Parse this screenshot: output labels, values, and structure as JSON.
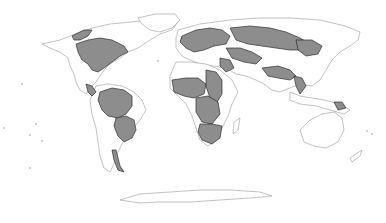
{
  "map": {
    "title": "",
    "projection": "world-pseudocylindrical",
    "background_color": "#ffffff",
    "coast_color": "#a8a8a8",
    "highlight_fill": "#8d8d8d",
    "highlight_stroke": "#2e2e2e",
    "land": [
      {
        "name": "north-america",
        "d": "M42 44 L60 40 L75 34 L92 28 L110 24 L130 22 L150 20 L170 18 L178 22 L172 30 L160 34 L150 40 L138 48 L128 52 L120 58 L110 64 L104 70 L100 76 L96 82 L90 88 L86 94 L80 90 L76 82 L74 74 L70 66 L68 58 L60 52 L50 48 Z"
      },
      {
        "name": "greenland",
        "d": "M138 18 L155 14 L175 14 L180 20 L172 28 L160 32 L150 30 L142 24 Z"
      },
      {
        "name": "south-america",
        "d": "M96 86 L108 84 L122 86 L134 92 L142 100 L146 110 L140 120 L132 130 L124 140 L118 152 L114 164 L110 172 L104 168 L100 156 L98 142 L96 128 L92 114 L90 100 Z"
      },
      {
        "name": "europe-asia",
        "d": "M178 30 L200 24 L230 20 L260 18 L290 18 L320 20 L345 26 L360 32 L358 40 L350 46 L340 52 L332 60 L326 70 L320 80 L312 86 L300 84 L290 88 L280 92 L272 90 L264 84 L256 80 L246 76 L236 74 L226 68 L214 66 L200 64 L190 60 L182 56 L176 48 L176 38 Z"
      },
      {
        "name": "africa",
        "d": "M176 62 L190 62 L206 64 L220 70 L232 80 L238 92 L232 104 L228 116 L222 128 L216 140 L208 146 L200 140 L196 128 L192 116 L186 104 L178 96 L170 88 L170 76 Z"
      },
      {
        "name": "madagascar",
        "d": "M234 122 L240 118 L238 130 L233 134 Z"
      },
      {
        "name": "southeast-asia-islands",
        "d": "M290 92 L300 96 L312 98 L324 100 L340 104 L350 110 L344 114 L330 110 L316 106 L300 104 L290 100 Z"
      },
      {
        "name": "australia",
        "d": "M300 130 L310 120 L322 114 L334 112 L342 118 L344 130 L338 142 L326 148 L314 146 L304 142 Z"
      },
      {
        "name": "new-zealand",
        "d": "M350 158 L362 150 L360 156 L352 162 Z"
      },
      {
        "name": "antarctica",
        "d": "M120 200 L140 194 L170 192 L200 190 L230 190 L260 192 L272 196 L250 198 L220 200 L190 202 L160 202 L140 203 Z"
      }
    ],
    "basins": [
      {
        "name": "mackenzie-basin",
        "d": "M72 36 L84 30 L92 30 L88 36 L80 40 L74 40 Z"
      },
      {
        "name": "nelson-mississippi-basin",
        "d": "M76 44 L88 40 L100 38 L112 40 L124 46 L128 52 L120 56 L112 62 L104 68 L98 72 L92 70 L88 64 L82 60 L78 52 Z"
      },
      {
        "name": "central-america-basin",
        "d": "M86 84 L92 86 L96 92 L92 96 L88 92 Z"
      },
      {
        "name": "amazon-basin",
        "d": "M100 92 L112 88 L124 90 L132 96 L132 106 L126 114 L118 118 L108 116 L102 110 L98 100 Z"
      },
      {
        "name": "parana-basin",
        "d": "M116 118 L126 116 L134 120 L136 130 L132 138 L124 142 L118 136 L114 126 Z"
      },
      {
        "name": "patagonia-strip",
        "d": "M112 150 L116 150 L120 166 L124 172 L118 170 L114 160 Z"
      },
      {
        "name": "europe-basins",
        "d": "M182 36 L196 30 L210 28 L222 30 L230 36 L226 44 L214 46 L204 50 L194 52 L186 48 L180 42 Z"
      },
      {
        "name": "ob-yenisei-basin",
        "d": "M230 28 L250 26 L270 28 L286 32 L300 38 L310 44 L304 50 L290 50 L276 48 L262 46 L248 44 L236 40 Z"
      },
      {
        "name": "lena-amur-basin",
        "d": "M296 40 L312 40 L322 46 L318 54 L306 56 L298 50 Z"
      },
      {
        "name": "central-asia-basin",
        "d": "M226 48 L240 48 L252 52 L262 58 L256 64 L244 62 L232 58 Z"
      },
      {
        "name": "indus-ganges-basin",
        "d": "M262 68 L278 66 L290 70 L296 76 L290 80 L278 78 L268 76 Z"
      },
      {
        "name": "mekong-basin",
        "d": "M294 76 L302 78 L306 86 L300 94 L296 86 Z"
      },
      {
        "name": "middle-east-basin",
        "d": "M220 58 L230 60 L234 68 L226 72 L220 66 Z"
      },
      {
        "name": "west-africa-basins",
        "d": "M172 80 L186 78 L198 78 L206 84 L204 94 L194 98 L184 96 L174 92 Z"
      },
      {
        "name": "nile-basin",
        "d": "M206 70 L216 72 L222 80 L222 94 L216 104 L210 98 L206 86 Z"
      },
      {
        "name": "congo-basin",
        "d": "M196 98 L208 96 L218 102 L220 114 L212 124 L202 122 L196 112 Z"
      },
      {
        "name": "zambezi-orange-basin",
        "d": "M200 124 L212 124 L222 126 L220 138 L212 144 L202 140 L198 132 Z"
      },
      {
        "name": "new-guinea-basin",
        "d": "M334 102 L342 102 L346 108 L338 110 Z"
      }
    ],
    "islands": [
      {
        "name": "pacific-dot",
        "cx": 22,
        "cy": 84,
        "r": 0.9
      },
      {
        "name": "pacific-dot",
        "cx": 4,
        "cy": 128,
        "r": 0.9
      },
      {
        "name": "pacific-dot",
        "cx": 36,
        "cy": 124,
        "r": 0.9
      },
      {
        "name": "pacific-dot",
        "cx": 30,
        "cy": 135,
        "r": 0.9
      },
      {
        "name": "pacific-dot",
        "cx": 42,
        "cy": 141,
        "r": 0.9
      },
      {
        "name": "pacific-dot",
        "cx": 30,
        "cy": 168,
        "r": 0.9
      },
      {
        "name": "atlantic-dot",
        "cx": 158,
        "cy": 61,
        "r": 0.9
      },
      {
        "name": "pacific-dot",
        "cx": 367,
        "cy": 131,
        "r": 0.9
      },
      {
        "name": "pacific-dot",
        "cx": 372,
        "cy": 134,
        "r": 0.9
      }
    ]
  }
}
